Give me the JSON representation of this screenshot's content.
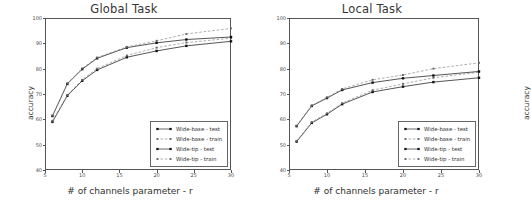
{
  "figure": {
    "panels": [
      {
        "id": "global",
        "title": "Global Task",
        "xlabel": "# of channels parameter - r",
        "ylabel": "accuracy"
      },
      {
        "id": "local",
        "title": "Local Task",
        "xlabel": "# of channels parameter - r",
        "ylabel": "accuracy"
      }
    ],
    "legend_labels": [
      "Wide-base - test",
      "Wide-base - train",
      "Wide-tip - test",
      "Wide-tip - train"
    ]
  },
  "chart_data": [
    {
      "type": "line",
      "title": "Global Task",
      "xlabel": "# of channels parameter - r",
      "ylabel": "accuracy",
      "xlim": [
        5,
        30
      ],
      "ylim": [
        40,
        100
      ],
      "xticks": [
        5,
        10,
        15,
        20,
        25,
        30
      ],
      "yticks": [
        40,
        50,
        60,
        70,
        80,
        90,
        100
      ],
      "grid": false,
      "legend_position": "lower right",
      "x": [
        6,
        8,
        10,
        12,
        16,
        20,
        24,
        30
      ],
      "series": [
        {
          "name": "Wide-base - test",
          "linestyle": "solid",
          "color": "#2a2a2a",
          "values": [
            59.0,
            69.3,
            75.2,
            79.5,
            84.5,
            87.0,
            89.0,
            90.8
          ]
        },
        {
          "name": "Wide-base - train",
          "linestyle": "dashed",
          "color": "#8a8a8a",
          "values": [
            59.4,
            69.6,
            75.6,
            80.0,
            85.2,
            88.3,
            90.3,
            92.0
          ]
        },
        {
          "name": "Wide-tip - test",
          "linestyle": "solid",
          "color": "#2a2a2a",
          "values": [
            61.3,
            74.0,
            79.8,
            84.1,
            88.3,
            90.2,
            91.5,
            92.5
          ]
        },
        {
          "name": "Wide-tip - train",
          "linestyle": "dashed",
          "color": "#8a8a8a",
          "values": [
            61.5,
            74.2,
            80.1,
            84.4,
            88.6,
            91.0,
            93.7,
            95.9
          ]
        }
      ]
    },
    {
      "type": "line",
      "title": "Local Task",
      "xlabel": "# of channels parameter - r",
      "ylabel": "accuracy",
      "xlim": [
        5,
        30
      ],
      "ylim": [
        40,
        100
      ],
      "xticks": [
        5,
        10,
        15,
        20,
        25,
        30
      ],
      "yticks": [
        40,
        50,
        60,
        70,
        80,
        90,
        100
      ],
      "grid": false,
      "legend_position": "lower right",
      "x": [
        6,
        8,
        10,
        12,
        16,
        20,
        24,
        30
      ],
      "series": [
        {
          "name": "Wide-base - test",
          "linestyle": "solid",
          "color": "#2a2a2a",
          "values": [
            51.2,
            58.6,
            62.0,
            66.0,
            70.8,
            72.9,
            74.7,
            76.4
          ]
        },
        {
          "name": "Wide-base - train",
          "linestyle": "dashed",
          "color": "#8a8a8a",
          "values": [
            51.5,
            58.9,
            62.4,
            66.4,
            71.5,
            74.0,
            76.4,
            78.6
          ]
        },
        {
          "name": "Wide-tip - test",
          "linestyle": "solid",
          "color": "#2a2a2a",
          "values": [
            57.3,
            65.3,
            68.4,
            71.6,
            74.5,
            76.2,
            77.3,
            78.9
          ]
        },
        {
          "name": "Wide-tip - train",
          "linestyle": "dashed",
          "color": "#8a8a8a",
          "values": [
            57.5,
            65.5,
            68.7,
            72.0,
            75.6,
            77.5,
            80.0,
            82.3
          ]
        }
      ]
    }
  ]
}
